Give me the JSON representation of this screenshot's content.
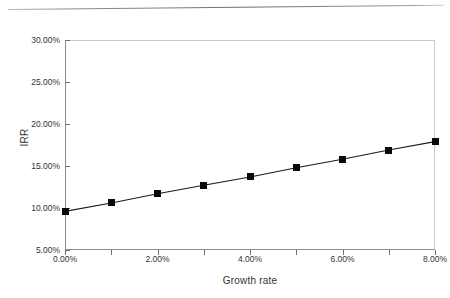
{
  "page": {
    "rule_name": "horizontal-rule"
  },
  "chart_data": {
    "type": "line",
    "title": "",
    "xlabel": "Growth rate",
    "ylabel": "IRR",
    "x": [
      0,
      1,
      2,
      3,
      4,
      5,
      6,
      7,
      8
    ],
    "values": [
      9.6,
      10.6,
      11.7,
      12.7,
      13.7,
      14.8,
      15.8,
      16.9,
      17.9
    ],
    "series": [
      {
        "name": "IRR",
        "values": [
          9.6,
          10.6,
          11.7,
          12.7,
          13.7,
          14.8,
          15.8,
          16.9,
          17.9
        ]
      }
    ],
    "xlim": [
      0,
      8
    ],
    "ylim": [
      5,
      30
    ],
    "x_tick_values": [
      0,
      1,
      2,
      3,
      4,
      5,
      6,
      7,
      8
    ],
    "x_tick_labels": [
      "0.00%",
      "",
      "2.00%",
      "",
      "4.00%",
      "",
      "6.00%",
      "",
      "8.00%"
    ],
    "y_tick_values": [
      5,
      10,
      15,
      20,
      25,
      30
    ],
    "y_tick_labels": [
      "5.00%",
      "10.00%",
      "15.00%",
      "20.00%",
      "25.00%",
      "30.00%"
    ],
    "grid": false,
    "legend": false,
    "legend_position": "none",
    "marker": "filled-square",
    "marker_color": "#0a0a0a",
    "line_color": "#1a1a1a"
  }
}
